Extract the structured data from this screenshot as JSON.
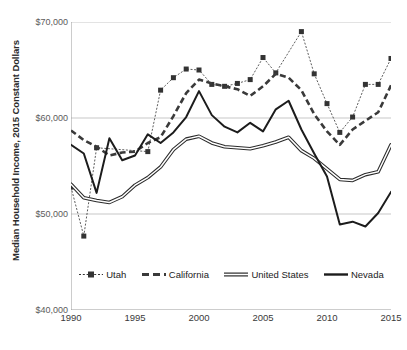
{
  "chart_data": {
    "type": "line",
    "title": "",
    "xlabel": "",
    "ylabel": "Median Household Income, 2015 Constant Dollars",
    "xlim": [
      1990,
      2015
    ],
    "ylim": [
      40000,
      70000
    ],
    "grid": true,
    "legend_position": "inside-bottom",
    "y_ticks": [
      40000,
      50000,
      60000,
      70000
    ],
    "y_tick_labels": [
      "$40,000",
      "$50,000",
      "$60,000",
      "$70,000"
    ],
    "x_ticks": [
      1990,
      1995,
      2000,
      2005,
      2010,
      2015
    ],
    "x_tick_labels": [
      "1990",
      "1995",
      "2000",
      "2005",
      "2010",
      "2015"
    ],
    "x_minor_ticks_every": 1,
    "x": [
      1990,
      1991,
      1992,
      1993,
      1994,
      1995,
      1996,
      1997,
      1998,
      1999,
      2000,
      2001,
      2002,
      2003,
      2004,
      2005,
      2006,
      2007,
      2008,
      2009,
      2010,
      2011,
      2012,
      2013,
      2014,
      2015
    ],
    "series": [
      {
        "name": "Utah",
        "style": "dotted-marker",
        "color": "#333333",
        "marker": "square",
        "values": [
          52800,
          47700,
          56900,
          null,
          null,
          null,
          56500,
          62900,
          64200,
          65100,
          65000,
          63500,
          63300,
          63600,
          64000,
          66300,
          64700,
          null,
          69000,
          64600,
          61500,
          58500,
          60100,
          63500,
          63500,
          66200
        ]
      },
      {
        "name": "California",
        "style": "dashed",
        "color": "#3a3a3a",
        "values": [
          58700,
          57700,
          57000,
          56100,
          56400,
          56500,
          57400,
          58000,
          60200,
          62600,
          64000,
          63600,
          63300,
          63000,
          62300,
          63300,
          64600,
          64200,
          62900,
          60400,
          58600,
          57200,
          58800,
          59700,
          60600,
          63400
        ]
      },
      {
        "name": "United States",
        "style": "double-line",
        "color": "#2b2b2b",
        "values": [
          53100,
          51700,
          51400,
          51200,
          51800,
          53000,
          53800,
          54900,
          56700,
          57800,
          58100,
          57400,
          57000,
          56900,
          56800,
          57100,
          57500,
          58000,
          56600,
          55800,
          54700,
          53600,
          53500,
          54100,
          54400,
          57200
        ]
      },
      {
        "name": "Nevada",
        "style": "solid",
        "color": "#1c1c1c",
        "values": [
          57200,
          56300,
          52200,
          57900,
          55600,
          56100,
          58300,
          57400,
          58500,
          60100,
          62800,
          60300,
          59100,
          58500,
          59500,
          58600,
          60900,
          61800,
          58800,
          56300,
          53900,
          48900,
          49200,
          48700,
          50100,
          52300
        ]
      }
    ]
  }
}
